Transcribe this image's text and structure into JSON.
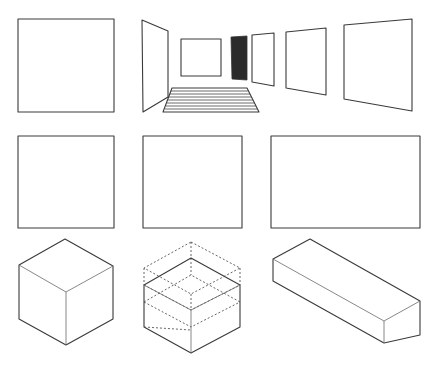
{
  "diagram": {
    "title": "",
    "stroke_color": "#3a3a3a",
    "background": "#ffffff",
    "rows": [
      {
        "name": "row-1",
        "items": [
          {
            "name": "square-1",
            "type": "polygon",
            "points": "18,19 114,19 114,112 18,112"
          },
          {
            "name": "perspective-room",
            "type": "group",
            "parts": [
              {
                "name": "left-wall-panel",
                "points": "142,20 168,31 168,97 143,112"
              },
              {
                "name": "back-square",
                "points": "181,39 221,39 221,76 181,76"
              },
              {
                "name": "dark-panel",
                "points": "231,37 247,36 247,80 232,79",
                "fill": "#2b2b2b"
              },
              {
                "name": "right-panel-1",
                "points": "252,35 274,33 274,86 252,82"
              },
              {
                "name": "right-panel-2",
                "points": "286,32 326,28 326,95 286,88"
              },
              {
                "name": "right-panel-3",
                "points": "344,25 412,19 412,111 344,99"
              },
              {
                "name": "striped-floor",
                "points": "172,88 247,88 259,112 163,112",
                "stripes": 8
              }
            ]
          }
        ]
      },
      {
        "name": "row-2",
        "items": [
          {
            "name": "square-2",
            "type": "polygon",
            "points": "18,136 114,136 114,228 18,228"
          },
          {
            "name": "square-3",
            "type": "polygon",
            "points": "143,136 242,136 242,228 143,228"
          },
          {
            "name": "rectangle-wide",
            "type": "polygon",
            "points": "271,136 420,136 420,228 271,228"
          }
        ]
      },
      {
        "name": "row-3",
        "items": [
          {
            "name": "isometric-cube",
            "type": "cube",
            "top": [
              65,
              239
            ],
            "left": [
              19,
              265
            ],
            "right": [
              113,
              266
            ],
            "center": [
              66,
              292
            ],
            "left_bottom": [
              19,
              319
            ],
            "right_bottom": [
              113,
              319
            ],
            "bottom": [
              66,
              345
            ]
          },
          {
            "name": "dashed-construction-cube",
            "type": "cube-dashed"
          },
          {
            "name": "isometric-box",
            "type": "box"
          }
        ]
      }
    ]
  }
}
